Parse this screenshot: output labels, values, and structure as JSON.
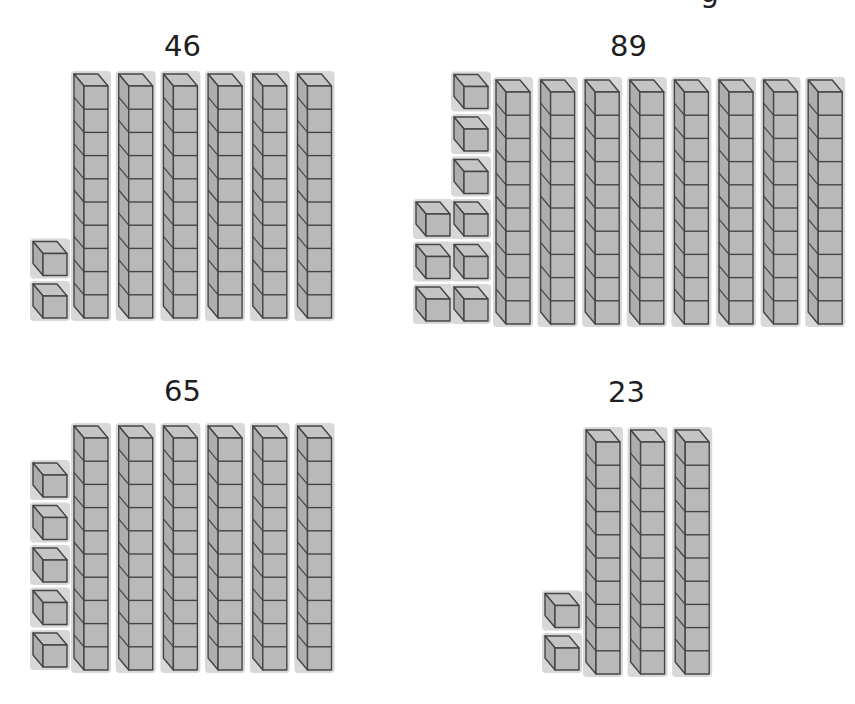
{
  "header": {
    "cutoff_text": "g"
  },
  "style": {
    "cube_fill": "#b9b9b9",
    "cube_line": "#454545",
    "text_color": "#1e1e1e"
  },
  "problems": [
    {
      "label": "46",
      "label_pos": [
        164,
        32
      ],
      "tens_rods": 6,
      "ones_cubes": 2,
      "rods_origin": [
        74,
        74
      ],
      "rod_pitch": 44.7,
      "rod_cube_h": 23.2,
      "ones_columns": [
        {
          "x": 33,
          "bottom": 318,
          "count": 2
        }
      ]
    },
    {
      "label": "89",
      "label_pos": [
        610,
        32
      ],
      "tens_rods": 8,
      "ones_cubes": 9,
      "rods_origin": [
        496,
        80
      ],
      "rod_pitch": 44.6,
      "rod_cube_h": 23.2,
      "ones_columns": [
        {
          "x": 416,
          "bottom": 321,
          "count": 3
        },
        {
          "x": 454,
          "bottom": 321,
          "count": 6
        }
      ]
    },
    {
      "label": "65",
      "label_pos": [
        164,
        377
      ],
      "tens_rods": 6,
      "ones_cubes": 5,
      "rods_origin": [
        74,
        426
      ],
      "rod_pitch": 44.7,
      "rod_cube_h": 23.2,
      "ones_columns": [
        {
          "x": 33,
          "bottom": 667,
          "count": 5
        }
      ]
    },
    {
      "label": "23",
      "label_pos": [
        608,
        378
      ],
      "tens_rods": 3,
      "ones_cubes": 2,
      "rods_origin": [
        586,
        430
      ],
      "rod_pitch": 44.6,
      "rod_cube_h": 23.2,
      "ones_columns": [
        {
          "x": 545,
          "bottom": 670,
          "count": 2
        }
      ]
    }
  ]
}
